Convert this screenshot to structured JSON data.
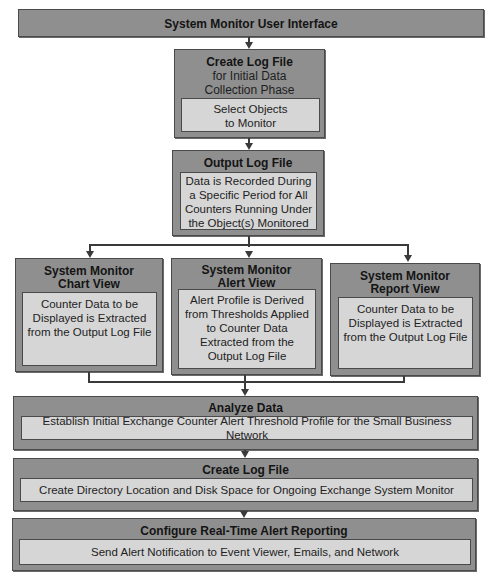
{
  "diagram": {
    "top": {
      "title": "System Monitor User Interface"
    },
    "create_log": {
      "title": "Create Log File",
      "subtitle_lines": [
        "for Initial Data",
        "Collection Phase"
      ],
      "inner_lines": [
        "Select Objects",
        "to Monitor"
      ]
    },
    "output_log": {
      "title": "Output Log File",
      "inner_lines": [
        "Data is Recorded During",
        "a Specific Period for All",
        "Counters Running Under",
        "the Object(s) Monitored"
      ]
    },
    "views": [
      {
        "title_lines": [
          "System Monitor",
          "Chart View"
        ],
        "inner_lines": [
          "Counter Data to be",
          "Displayed is Extracted",
          "from the Output Log File"
        ]
      },
      {
        "title_lines": [
          "System Monitor",
          "Alert View"
        ],
        "inner_lines": [
          "Alert Profile is Derived",
          "from Thresholds Applied",
          "to Counter Data",
          "Extracted from the",
          "Output Log File"
        ]
      },
      {
        "title_lines": [
          "System Monitor",
          "Report View"
        ],
        "inner_lines": [
          "Counter Data to be",
          "Displayed is Extracted",
          "from the Output Log File"
        ]
      }
    ],
    "analyze": {
      "title": "Analyze Data",
      "inner": "Establish Initial Exchange Counter Alert Threshold Profile for the Small Business Network"
    },
    "create_log_2": {
      "title": "Create Log File",
      "inner": "Create Directory Location and Disk Space for Ongoing Exchange System Monitor"
    },
    "configure": {
      "title": "Configure Real-Time Alert Reporting",
      "inner": "Send Alert Notification to Event Viewer, Emails, and Network"
    },
    "colors": {
      "outer_box": "#8f8f8f",
      "inner_box": "#d6d6d6",
      "border": "#4a4a4a",
      "connector": "#3a3a3a"
    }
  }
}
